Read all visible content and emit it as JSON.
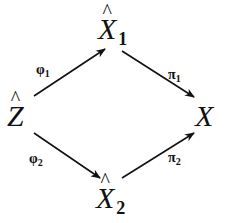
{
  "diagram": {
    "type": "commutative-diagram",
    "nodes": {
      "x1hat": {
        "base": "X",
        "hat": "^",
        "sub": "1"
      },
      "zhat": {
        "base": "Z",
        "hat": "^",
        "sub": ""
      },
      "x": {
        "base": "X",
        "hat": "",
        "sub": ""
      },
      "x2hat": {
        "base": "X",
        "hat": "^",
        "sub": "2"
      }
    },
    "edges": [
      {
        "from": "Ẑ",
        "to": "X̂1",
        "label": "φ",
        "sub": "1"
      },
      {
        "from": "X̂1",
        "to": "X",
        "label": "π",
        "sub": "1"
      },
      {
        "from": "Ẑ",
        "to": "X̂2",
        "label": "φ",
        "sub": "2"
      },
      {
        "from": "X̂2",
        "to": "X",
        "label": "π",
        "sub": "2"
      }
    ],
    "colors": {
      "ink": "#111111",
      "background": "#ffffff"
    }
  }
}
